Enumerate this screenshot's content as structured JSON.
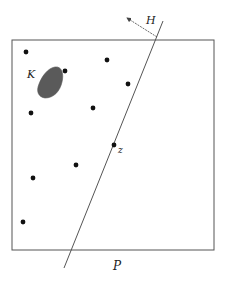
{
  "figure": {
    "width": 226,
    "height": 284,
    "colors": {
      "stroke": "#555555",
      "dot": "#111111",
      "blob": "#5a5a5a",
      "text": "#222222"
    },
    "region": {
      "x": 12,
      "y": 40,
      "w": 202,
      "h": 210,
      "label": "P",
      "label_x": 113,
      "label_y": 270
    },
    "convex_set": {
      "label": "K",
      "label_x": 27,
      "label_y": 78
    },
    "hyperplane": {
      "x1": 163,
      "y1": 21,
      "x2": 64,
      "y2": 268,
      "label": "H",
      "label_x": 146,
      "label_y": 24
    },
    "normal_arrow": {
      "x1": 157,
      "y1": 37,
      "x2": 127,
      "y2": 18
    },
    "point_z": {
      "x": 114,
      "y": 145,
      "label": "z",
      "label_x": 118,
      "label_y": 153
    },
    "points": [
      {
        "x": 26,
        "y": 52
      },
      {
        "x": 107,
        "y": 60
      },
      {
        "x": 65,
        "y": 71
      },
      {
        "x": 128,
        "y": 84
      },
      {
        "x": 31,
        "y": 113
      },
      {
        "x": 93,
        "y": 108
      },
      {
        "x": 114,
        "y": 145
      },
      {
        "x": 76,
        "y": 165
      },
      {
        "x": 33,
        "y": 178
      },
      {
        "x": 23,
        "y": 222
      }
    ]
  }
}
